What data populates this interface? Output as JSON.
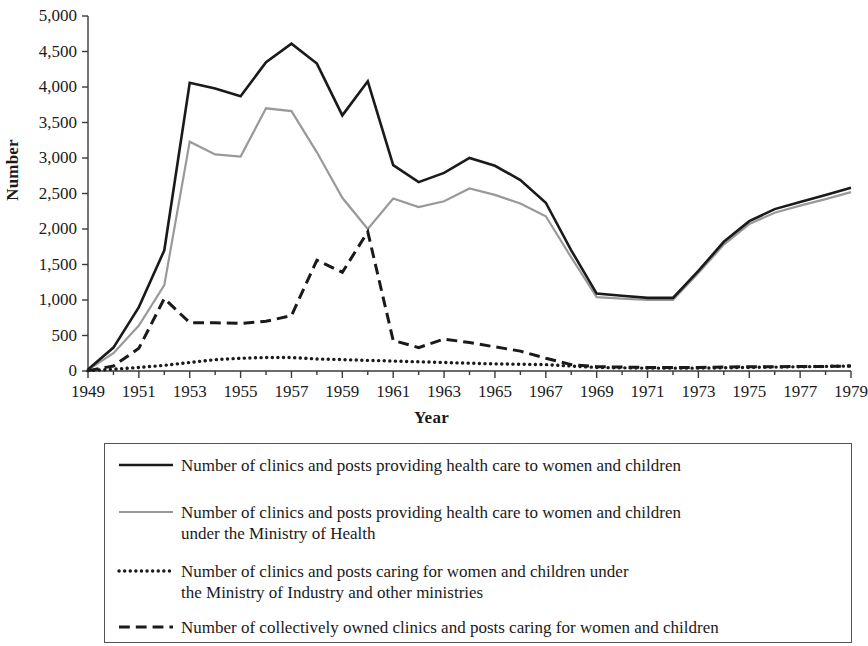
{
  "chart_data": {
    "type": "line",
    "title": "",
    "xlabel": "Year",
    "ylabel": "Number",
    "xlim": [
      1949,
      1979
    ],
    "ylim": [
      0,
      5000
    ],
    "grid": false,
    "legend_position": "below",
    "x": [
      1949,
      1950,
      1951,
      1952,
      1953,
      1954,
      1955,
      1956,
      1957,
      1958,
      1959,
      1960,
      1961,
      1962,
      1963,
      1964,
      1965,
      1966,
      1967,
      1968,
      1969,
      1970,
      1971,
      1972,
      1973,
      1974,
      1975,
      1976,
      1977,
      1978,
      1979
    ],
    "x_tick_labels": [
      "1949",
      "1951",
      "1953",
      "1955",
      "1957",
      "1959",
      "1961",
      "1963",
      "1965",
      "1967",
      "1969",
      "1971",
      "1973",
      "1975",
      "1977",
      "1979"
    ],
    "y_tick_labels": [
      "0",
      "500",
      "1,000",
      "1,500",
      "2,000",
      "2,500",
      "3,000",
      "3,500",
      "4,000",
      "4,500",
      "5,000"
    ],
    "y_ticks": [
      0,
      500,
      1000,
      1500,
      2000,
      2500,
      3000,
      3500,
      4000,
      4500,
      5000
    ],
    "series": [
      {
        "name": "total",
        "style": "solid",
        "color": "#1a1a1a",
        "width": 2.6,
        "legend": {
          "line1": "Number of clinics and posts providing health care to women and children",
          "line2": ""
        },
        "values": [
          20,
          330,
          900,
          1700,
          4060,
          3980,
          3870,
          4350,
          4610,
          4330,
          3600,
          4080,
          2900,
          2660,
          2790,
          3000,
          2890,
          2690,
          2370,
          1700,
          1090,
          1060,
          1030,
          1030,
          1410,
          1820,
          2110,
          2280,
          2380,
          2480,
          2580
        ]
      },
      {
        "name": "ministry_of_health",
        "style": "solid",
        "color": "#999999",
        "width": 2.2,
        "legend": {
          "line1": "Number of clinics and posts providing health care to women and children",
          "line2": "under the Ministry of Health"
        },
        "values": [
          15,
          250,
          640,
          1210,
          3230,
          3050,
          3020,
          3700,
          3660,
          3080,
          2440,
          2000,
          2430,
          2310,
          2390,
          2570,
          2480,
          2360,
          2180,
          1600,
          1040,
          1020,
          1000,
          1000,
          1380,
          1780,
          2070,
          2230,
          2330,
          2420,
          2520
        ]
      },
      {
        "name": "industry_and_other_ministries",
        "style": "dotted",
        "color": "#1a1a1a",
        "width": 3.4,
        "legend": {
          "line1": "Number of clinics and posts caring for women and children under",
          "line2": "the Ministry of Industry and other ministries"
        },
        "values": [
          5,
          25,
          50,
          80,
          120,
          160,
          180,
          190,
          190,
          170,
          160,
          150,
          140,
          130,
          120,
          110,
          100,
          95,
          90,
          70,
          50,
          45,
          40,
          40,
          40,
          45,
          50,
          55,
          60,
          65,
          70
        ]
      },
      {
        "name": "collectively_owned",
        "style": "dashed",
        "color": "#1a1a1a",
        "width": 3.0,
        "legend": {
          "line1": "Number of collectively owned clinics and posts caring for women and children",
          "line2": ""
        },
        "values": [
          5,
          70,
          320,
          1020,
          680,
          680,
          670,
          700,
          780,
          1560,
          1390,
          1960,
          430,
          330,
          450,
          400,
          340,
          280,
          180,
          90,
          60,
          55,
          50,
          50,
          50,
          55,
          60,
          60,
          65,
          65,
          70
        ]
      }
    ]
  }
}
